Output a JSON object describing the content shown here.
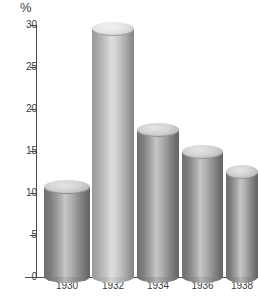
{
  "chart_data": {
    "type": "bar",
    "title": "",
    "subtitle": "",
    "xlabel": "",
    "ylabel": "%",
    "categories": [
      "1930",
      "1932",
      "1934",
      "1936",
      "1938"
    ],
    "values": [
      10.7,
      29.5,
      17.5,
      14.9,
      12.5
    ],
    "ylim": [
      0,
      30
    ],
    "yticks": [
      "0",
      "5",
      "10",
      "15",
      "20",
      "25",
      "30"
    ],
    "ytick_values": [
      0,
      5,
      10,
      15,
      20,
      25,
      30
    ],
    "grid": false,
    "legend": null,
    "annotations": [],
    "style": {
      "render": "3d-cylinder",
      "palette": "grayscale",
      "bar_fill_dark": "#8d8d8d",
      "bar_fill_light": "#c4c4c4",
      "bar_top_dark": "#d2d2d2",
      "bar_top_light": "#e4e4e4",
      "axis_color": "#4a4a4a",
      "text_color": "#3c3c3c",
      "background": "#ffffff",
      "highlighted_index": 1
    },
    "bars": [
      {
        "category": "1930",
        "value": 10.7,
        "shade": "dark"
      },
      {
        "category": "1932",
        "value": 29.5,
        "shade": "light"
      },
      {
        "category": "1934",
        "value": 17.5,
        "shade": "dark"
      },
      {
        "category": "1936",
        "value": 14.9,
        "shade": "dark"
      },
      {
        "category": "1938",
        "value": 12.5,
        "shade": "dark"
      }
    ]
  }
}
